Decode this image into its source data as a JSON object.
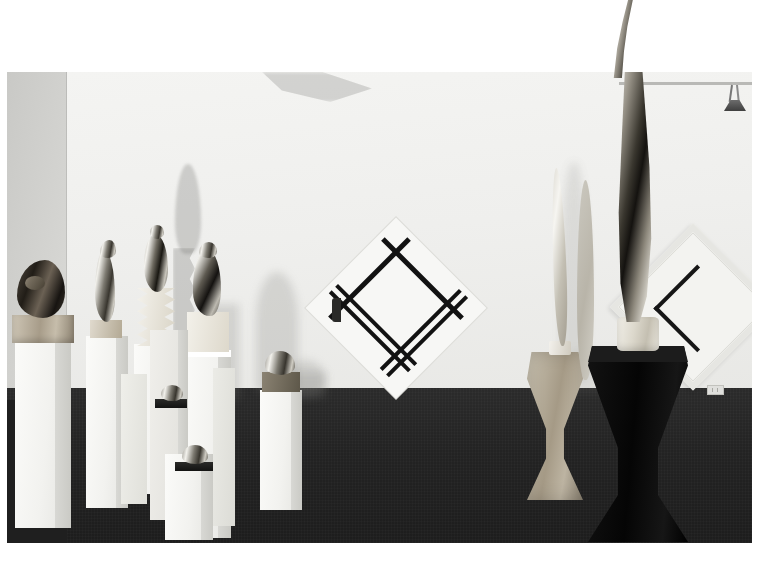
{
  "image": {
    "kind": "photograph",
    "subject": "art-gallery-installation-view",
    "border_color": "#ffffff",
    "description": "Gallery installation view: polished bronze Brancusi-style sculptures on white plinths at left and centre, two tall Bird-in-Space forms and a black flared pedestal at right, two diamond (lozenge) Mondrian-style paintings on the white back wall, dark grey carpet floor."
  },
  "scene": {
    "room": {
      "back_wall_color": "#efefed",
      "left_wall_color": "#d2d2cf",
      "ceiling_color": "#eaeae8",
      "floor_color": "#232323",
      "baseboard_color": "#e2e2df"
    },
    "lighting": {
      "fixture": "track-spotlight",
      "position": "ceiling-right",
      "rail_color": "#b9b9b6",
      "head_color": "#4a4a4a"
    },
    "wall_outlet": {
      "present": true
    }
  },
  "artworks": [
    {
      "id": "artwork-mondrian",
      "name": "Diamond composition with black lines",
      "form": "lozenge",
      "canvas_color": "#f7f7f5",
      "line_color": "#121212",
      "lines": [
        {
          "orientation": "horizontal",
          "thickness": 4
        },
        {
          "orientation": "horizontal",
          "thickness": 3
        },
        {
          "orientation": "horizontal",
          "thickness": 3
        },
        {
          "orientation": "vertical",
          "thickness": 4
        },
        {
          "orientation": "vertical",
          "thickness": 3
        },
        {
          "orientation": "vertical",
          "thickness": 3
        }
      ]
    },
    {
      "id": "artwork-cross",
      "name": "Framed diamond with black cross",
      "form": "lozenge",
      "canvas_color": "#f3f3f0",
      "frame_color": "#e6e6e2",
      "line_color": "#161616",
      "lines": [
        {
          "orientation": "vertical",
          "thickness": 4
        },
        {
          "orientation": "horizontal",
          "thickness": 4
        }
      ]
    }
  ],
  "sculptures": [
    {
      "id": "sculpture-head-left",
      "name": "Reclining head",
      "material": "dark-patinated-bronze",
      "base": "travertine-block",
      "plinth": "white-plinth-tall"
    },
    {
      "id": "sculpture-bird-1",
      "name": "Bird form",
      "material": "polished-bronze",
      "base": "stone-block",
      "plinth": "white-plinth-tall"
    },
    {
      "id": "sculpture-bird-2",
      "name": "Bird with zigzag base",
      "material": "polished-bronze",
      "base": "carved-zigzag",
      "plinth": "white-plinth-tall"
    },
    {
      "id": "sculpture-bird-3",
      "name": "Bird form small",
      "material": "polished-bronze",
      "base": "stone-block",
      "plinth": "white-plinth-mid"
    },
    {
      "id": "sculpture-egg-1",
      "name": "Ovoid head",
      "material": "polished-bronze",
      "base": "slate-slab",
      "plinth": "white-plinth-short"
    },
    {
      "id": "sculpture-egg-2",
      "name": "Ovoid head low",
      "material": "polished-bronze",
      "base": "slate-slab",
      "plinth": "white-plinth-low"
    },
    {
      "id": "sculpture-egg-3",
      "name": "Ovoid head right",
      "material": "polished-bronze",
      "base": "bronze-block",
      "plinth": "white-plinth-tall"
    },
    {
      "id": "sculpture-blade-white",
      "name": "Slender blade form",
      "material": "pale-stone",
      "base": "disc",
      "plinth": "stone-flared-pedestal"
    },
    {
      "id": "sculpture-bird-space",
      "name": "Bird in Space",
      "material": "polished-bronze",
      "base": "marble-cylinder",
      "plinth": "black-flared-pedestal"
    }
  ],
  "pedestals": [
    {
      "id": "plinth-1",
      "color": "#f6f6f3",
      "shape": "rectangular-column"
    },
    {
      "id": "plinth-2",
      "color": "#f6f6f3",
      "shape": "rectangular-column"
    },
    {
      "id": "plinth-3",
      "color": "#f6f6f3",
      "shape": "rectangular-column"
    },
    {
      "id": "plinth-4",
      "color": "#f6f6f3",
      "shape": "rectangular-column"
    },
    {
      "id": "plinth-5",
      "color": "#f6f6f3",
      "shape": "rectangular-column"
    },
    {
      "id": "plinth-6",
      "color": "#f6f6f3",
      "shape": "rectangular-column"
    },
    {
      "id": "plinth-7",
      "color": "#f6f6f3",
      "shape": "rectangular-column"
    },
    {
      "id": "pedestal-stone",
      "color": "#b9b3a4",
      "shape": "flared-hourglass"
    },
    {
      "id": "pedestal-black",
      "color": "#0d0d0d",
      "shape": "flared-hourglass"
    }
  ]
}
